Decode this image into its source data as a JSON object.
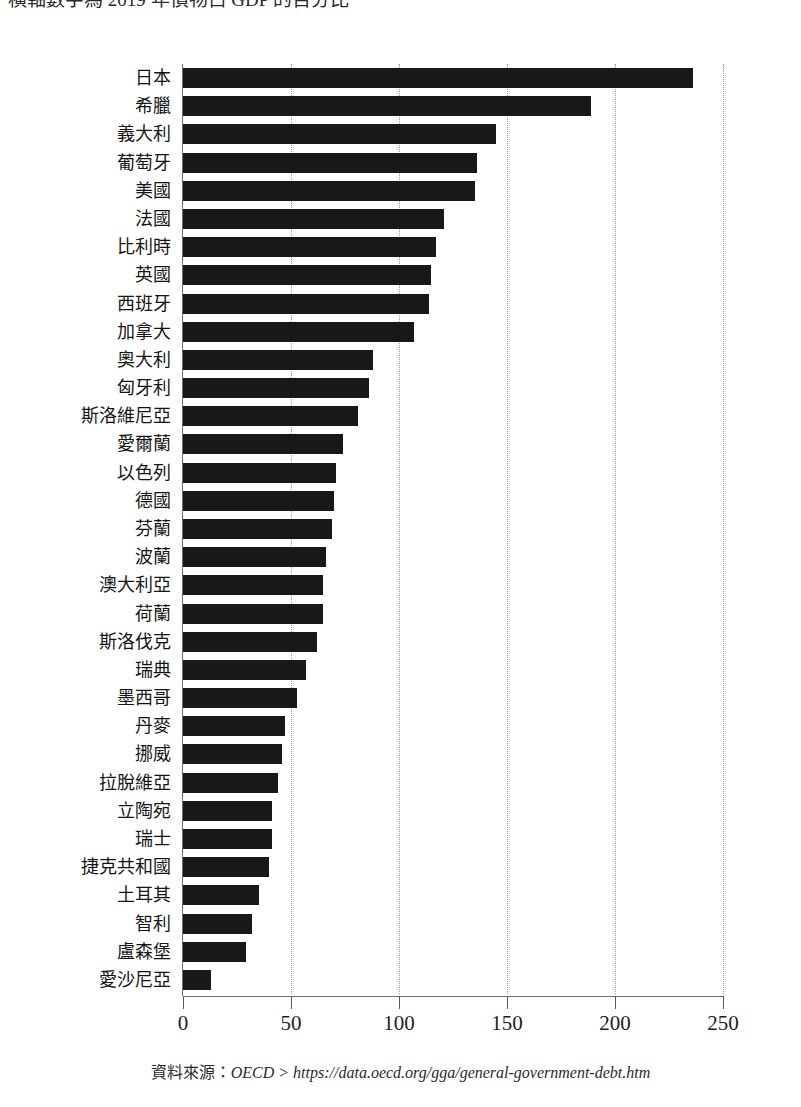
{
  "caption": {
    "text": "橫軸數字為 2019 年債物占 GDP 的百分比"
  },
  "source": {
    "label": "資料來源：",
    "url": "OECD > https://data.oecd.org/gga/general-government-debt.htm"
  },
  "chart_data": {
    "type": "bar",
    "orientation": "horizontal",
    "title": "",
    "subtitle": "",
    "xlabel": "",
    "ylabel": "",
    "xlim": [
      0,
      250
    ],
    "xticks": [
      0,
      50,
      100,
      150,
      200,
      250
    ],
    "xtick_labels": [
      "0",
      "50",
      "100",
      "150",
      "200",
      "250"
    ],
    "grid": "vertical-dotted",
    "legend": "none",
    "bar_color": "#181818",
    "categories": [
      "日本",
      "希臘",
      "義大利",
      "葡萄牙",
      "美國",
      "法國",
      "比利時",
      "英國",
      "西班牙",
      "加拿大",
      "奧大利",
      "匈牙利",
      "斯洛維尼亞",
      "愛爾蘭",
      "以色列",
      "德國",
      "芬蘭",
      "波蘭",
      "澳大利亞",
      "荷蘭",
      "斯洛伐克",
      "瑞典",
      "墨西哥",
      "丹麥",
      "挪威",
      "拉脫維亞",
      "立陶宛",
      "瑞士",
      "捷克共和國",
      "土耳其",
      "智利",
      "盧森堡",
      "愛沙尼亞"
    ],
    "values": [
      236,
      189,
      145,
      136,
      135,
      121,
      117,
      115,
      114,
      107,
      88,
      86,
      81,
      74,
      71,
      70,
      69,
      66,
      65,
      65,
      62,
      57,
      53,
      47,
      46,
      44,
      41,
      41,
      40,
      35,
      32,
      29,
      13
    ]
  }
}
